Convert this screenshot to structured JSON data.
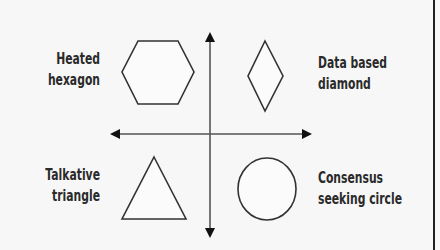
{
  "diagram": {
    "quadrants": [
      {
        "position": "top-left",
        "shape": "hexagon",
        "label_line1": "Heated",
        "label_line2": "hexagon"
      },
      {
        "position": "top-right",
        "shape": "diamond",
        "label_line1": "Data based",
        "label_line2": "diamond"
      },
      {
        "position": "bottom-left",
        "shape": "triangle",
        "label_line1": "Talkative",
        "label_line2": "triangle"
      },
      {
        "position": "bottom-right",
        "shape": "circle",
        "label_line1": "Consensus",
        "label_line2": "seeking circle"
      }
    ],
    "axes": {
      "vertical": "double-arrow",
      "horizontal": "double-arrow"
    },
    "colors": {
      "stroke": "#2a2a2a",
      "background": "#f7f7f7"
    }
  }
}
